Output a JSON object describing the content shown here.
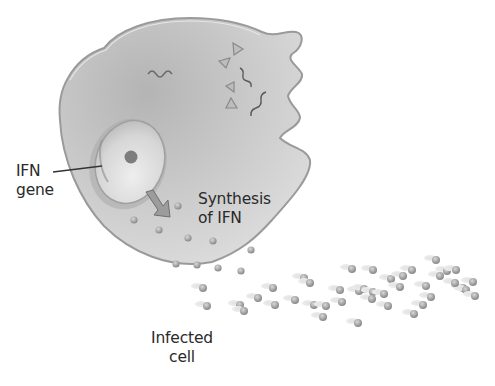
{
  "diagram": {
    "labels": {
      "ifn_gene": [
        "IFN",
        "gene"
      ],
      "synthesis": [
        "Synthesis",
        "of IFN"
      ],
      "infected_cell": [
        "Infected",
        "cell"
      ]
    },
    "elements": {
      "cell": "infected-cell",
      "nucleus": "nucleus-with-nucleolus",
      "viral_rna": "wavy-viral-rna-strands",
      "viral_proteins": "triangle-viral-proteins",
      "arrow": "synthesis-arrow",
      "ifn_molecules": "interferon-molecules-released"
    },
    "colors": {
      "cell_fill": "#c9c9c9",
      "cell_edge": "#9a9a9a",
      "nucleus_fill": "#dcdcdc",
      "molecule": "#9c9c9c",
      "text": "#2a2a2a"
    }
  }
}
